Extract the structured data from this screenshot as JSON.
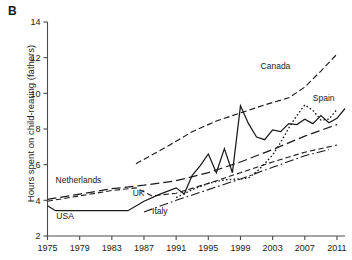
{
  "panel": {
    "label": "B"
  },
  "chart_data": {
    "type": "line",
    "title": "",
    "xlabel": "",
    "ylabel": "Hours spent on child-rearing (fathers)",
    "xlim": [
      1975,
      2012
    ],
    "ylim": [
      2,
      14
    ],
    "yticks": [
      2,
      4,
      6,
      8,
      10,
      12,
      14
    ],
    "xticks": [
      1975,
      1979,
      1983,
      1987,
      1991,
      1995,
      1999,
      2003,
      2007,
      2011
    ],
    "grid": false,
    "legend": "inline-labels",
    "series": [
      {
        "name": "USA",
        "style": "solid",
        "label_x": 1976.1,
        "label_y": 2.95,
        "points": [
          [
            1975,
            3.7
          ],
          [
            1976,
            3.42
          ],
          [
            1979,
            3.42
          ],
          [
            1983,
            3.42
          ],
          [
            1985,
            3.42
          ],
          [
            1987,
            3.95
          ],
          [
            1989,
            4.35
          ],
          [
            1991,
            4.7
          ],
          [
            1992,
            4.35
          ],
          [
            1993,
            5.4
          ],
          [
            1994,
            5.95
          ],
          [
            1995,
            6.6
          ],
          [
            1996,
            5.55
          ],
          [
            1997,
            6.9
          ],
          [
            1998,
            5.55
          ],
          [
            1999,
            9.3
          ],
          [
            2000,
            8.3
          ],
          [
            2001,
            7.55
          ],
          [
            2002,
            7.4
          ],
          [
            2003,
            7.95
          ],
          [
            2004,
            7.85
          ],
          [
            2005,
            8.3
          ],
          [
            2006,
            8.25
          ],
          [
            2007,
            8.55
          ],
          [
            2008,
            8.3
          ],
          [
            2009,
            8.75
          ],
          [
            2010,
            8.35
          ],
          [
            2011,
            8.6
          ],
          [
            2012,
            9.15
          ]
        ]
      },
      {
        "name": "Netherlands",
        "style": "long-dash",
        "label_x": 1976.0,
        "label_y": 4.95,
        "points": [
          [
            1975,
            4.05
          ],
          [
            1979,
            4.35
          ],
          [
            1983,
            4.65
          ],
          [
            1987,
            4.85
          ],
          [
            1991,
            5.1
          ],
          [
            1995,
            5.55
          ],
          [
            1999,
            6.15
          ],
          [
            2003,
            6.85
          ],
          [
            2007,
            7.6
          ],
          [
            2011,
            8.25
          ]
        ]
      },
      {
        "name": "UK",
        "style": "dash",
        "label_x": 1985.6,
        "label_y": 4.25,
        "points": [
          [
            1975,
            3.95
          ],
          [
            1979,
            4.25
          ],
          [
            1983,
            4.55
          ],
          [
            1986,
            4.7
          ],
          [
            1988,
            4.25
          ],
          [
            1991,
            4.4
          ],
          [
            1995,
            4.95
          ],
          [
            1999,
            5.55
          ],
          [
            2003,
            6.15
          ],
          [
            2007,
            6.7
          ],
          [
            2011,
            7.1
          ]
        ]
      },
      {
        "name": "Italy",
        "style": "dash-dot",
        "label_x": 1988.0,
        "label_y": 3.25,
        "points": [
          [
            1987,
            3.35
          ],
          [
            1991,
            4.0
          ],
          [
            1995,
            4.6
          ],
          [
            1999,
            5.2
          ],
          [
            2003,
            5.85
          ],
          [
            2007,
            6.5
          ],
          [
            2010,
            6.85
          ]
        ]
      },
      {
        "name": "Canada",
        "style": "medium-dash",
        "label_x": 2001.5,
        "label_y": 11.35,
        "points": [
          [
            1986,
            6.05
          ],
          [
            1990,
            7.05
          ],
          [
            1993,
            7.85
          ],
          [
            1996,
            8.45
          ],
          [
            1999,
            8.9
          ],
          [
            2002,
            9.35
          ],
          [
            2005,
            9.75
          ],
          [
            2007,
            10.35
          ],
          [
            2009,
            11.25
          ],
          [
            2011,
            12.2
          ]
        ]
      },
      {
        "name": "Spain",
        "style": "dotted",
        "label_x": 2008.0,
        "label_y": 9.55,
        "points": [
          [
            1991,
            4.15
          ],
          [
            1993,
            4.6
          ],
          [
            1995,
            4.95
          ],
          [
            1997,
            5.15
          ],
          [
            1999,
            5.2
          ],
          [
            2000,
            5.25
          ],
          [
            2001,
            5.6
          ],
          [
            2002,
            6.05
          ],
          [
            2003,
            6.55
          ],
          [
            2004,
            7.25
          ],
          [
            2005,
            8.05
          ],
          [
            2006,
            8.75
          ],
          [
            2007,
            9.35
          ],
          [
            2008,
            9.05
          ],
          [
            2009,
            8.5
          ],
          [
            2010,
            8.55
          ],
          [
            2011,
            9.1
          ]
        ]
      }
    ]
  }
}
